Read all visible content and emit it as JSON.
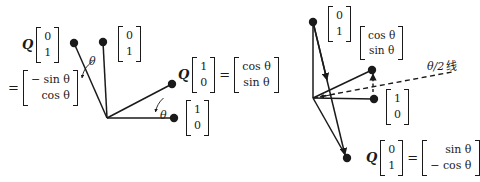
{
  "figure": {
    "background": "#ffffff",
    "stroke_color": "#1a1a1a",
    "width": 479,
    "height": 182
  },
  "left_panel": {
    "name": "rotation-diagram",
    "origin_label": "origin",
    "labels": {
      "q_e2_head": "Q",
      "q_e2_vector": [
        "0",
        "1"
      ],
      "q_e2_equals": "=",
      "q_e2_result": [
        "− sin θ",
        "cos θ"
      ],
      "e2_vector": [
        "0",
        "1"
      ],
      "q_e1_head": "Q",
      "q_e1_vector": [
        "1",
        "0"
      ],
      "q_e1_equals": "=",
      "q_e1_result": [
        "cos θ",
        "sin θ"
      ],
      "e1_vector": [
        "1",
        "0"
      ],
      "angle_upper": "θ",
      "angle_lower": "θ"
    }
  },
  "right_panel": {
    "name": "reflection-diagram",
    "labels": {
      "e2_vector": [
        "0",
        "1"
      ],
      "q_e1_result": [
        "cos θ",
        "sin θ"
      ],
      "e1_vector": [
        "1",
        "0"
      ],
      "half_line": "θ/2",
      "half_line_suffix": "线",
      "q_e2_head": "Q",
      "q_e2_vector": [
        "0",
        "1"
      ],
      "q_e2_equals": "=",
      "q_e2_result": [
        "sin θ",
        "− cos θ"
      ]
    }
  },
  "geometry": {
    "left": {
      "origin": [
        107,
        118
      ],
      "e2_tip": [
        103,
        42
      ],
      "q_e2_tip": [
        74,
        43
      ],
      "e1_tip": [
        174,
        118
      ],
      "q_e1_tip": [
        172,
        84
      ]
    },
    "right": {
      "origin": [
        313,
        98
      ],
      "e2_tip": [
        313,
        22
      ],
      "q_e2_tip": [
        347,
        158
      ],
      "e1_tip": [
        374,
        99
      ],
      "q_e1_tip": [
        372,
        70
      ],
      "dash_end": [
        452,
        72
      ]
    }
  }
}
